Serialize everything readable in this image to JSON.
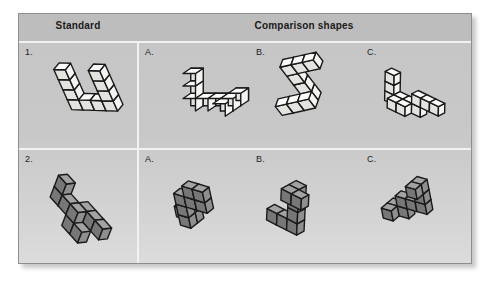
{
  "figure": {
    "title_row": {
      "standard_header": "Standard",
      "comparison_header": "Comparison shapes"
    },
    "rows": [
      {
        "number_label": "1.",
        "fill": "#f4f4f2",
        "shade_left": "#e3e3e0",
        "shade_top": "#fbfbfa",
        "items": [
          {
            "label": "A."
          },
          {
            "label": "B."
          },
          {
            "label": "C."
          }
        ]
      },
      {
        "number_label": "2.",
        "fill": "#8f8f8f",
        "shade_left": "#777777",
        "shade_top": "#a3a3a3",
        "items": [
          {
            "label": "A."
          },
          {
            "label": "B."
          },
          {
            "label": "C."
          }
        ]
      }
    ],
    "colors": {
      "panel_background": "#c9c9c9",
      "header_background": "#bdbdbd",
      "divider": "#f2f2f2",
      "outline": "#1a1a1a",
      "page_background": "#ffffff"
    }
  }
}
